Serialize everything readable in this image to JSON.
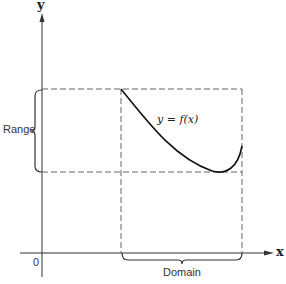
{
  "figure": {
    "x_axis_label": "x",
    "y_axis_label": "y",
    "origin_label": "0",
    "function_label": "y = f(x)",
    "range_label": "Range",
    "domain_label": "Domain"
  },
  "colors": {
    "axis": "#333333",
    "curve": "#111111",
    "dashed": "#666666",
    "brace": "#333333",
    "background": "#ffffff"
  }
}
